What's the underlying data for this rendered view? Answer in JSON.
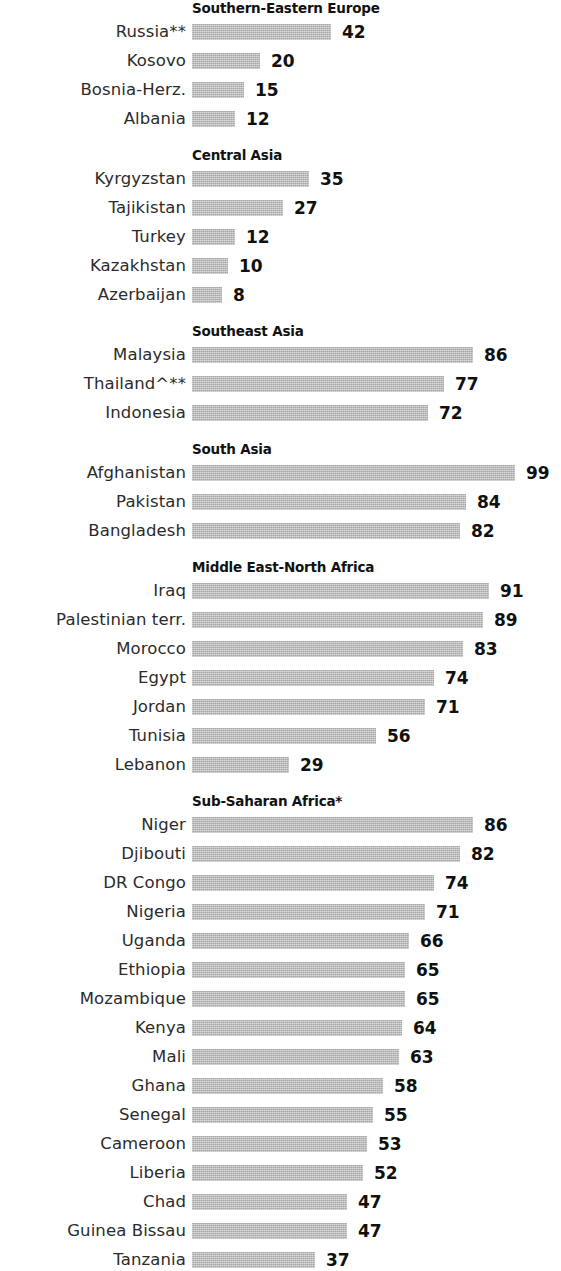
{
  "chart_data": {
    "type": "bar",
    "title": "",
    "subtitle": "",
    "xlabel": "",
    "ylabel": "",
    "orientation": "horizontal",
    "grid": false,
    "legend": null,
    "xlim": [
      0,
      100
    ],
    "value_suffix": "",
    "bar_color": "#b9b9b9",
    "groups": [
      {
        "name": "Southern-Eastern  Europe",
        "categories": [
          "Russia**",
          "Kosovo",
          "Bosnia-Herz.",
          "Albania"
        ],
        "values": [
          42,
          20,
          15,
          12
        ]
      },
      {
        "name": "Central Asia",
        "categories": [
          "Kyrgyzstan",
          "Tajikistan",
          "Turkey",
          "Kazakhstan",
          "Azerbaijan"
        ],
        "values": [
          35,
          27,
          12,
          10,
          8
        ]
      },
      {
        "name": "Southeast  Asia",
        "categories": [
          "Malaysia",
          "Thailand^**",
          "Indonesia"
        ],
        "values": [
          86,
          77,
          72
        ]
      },
      {
        "name": "South  Asia",
        "categories": [
          "Afghanistan",
          "Pakistan",
          "Bangladesh"
        ],
        "values": [
          99,
          84,
          82
        ]
      },
      {
        "name": "Middle East-North  Africa",
        "categories": [
          "Iraq",
          "Palestinian terr.",
          "Morocco",
          "Egypt",
          "Jordan",
          "Tunisia",
          "Lebanon"
        ],
        "values": [
          91,
          89,
          83,
          74,
          71,
          56,
          29
        ]
      },
      {
        "name": "Sub-Saharan  Africa*",
        "categories": [
          "Niger",
          "Djibouti",
          "DR Congo",
          "Nigeria",
          "Uganda",
          "Ethiopia",
          "Mozambique",
          "Kenya",
          "Mali",
          "Ghana",
          "Senegal",
          "Cameroon",
          "Liberia",
          "Chad",
          "Guinea Bissau",
          "Tanzania"
        ],
        "values": [
          86,
          82,
          74,
          71,
          66,
          65,
          65,
          64,
          63,
          58,
          55,
          53,
          52,
          47,
          47,
          37
        ]
      }
    ]
  }
}
